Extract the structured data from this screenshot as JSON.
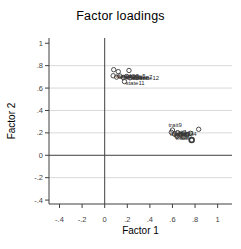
{
  "chart_data": {
    "type": "scatter",
    "title": "Factor loadings",
    "xlabel": "Factor 1",
    "ylabel": "Factor 2",
    "xlim": [
      -0.493,
      1.127
    ],
    "ylim": [
      -0.435,
      1.047
    ],
    "xticks": {
      "values": [
        -0.4,
        -0.2,
        0,
        0.2,
        0.4,
        0.6,
        0.8,
        1
      ],
      "labels": [
        "-.4",
        "-.2",
        "0",
        ".2",
        ".4",
        ".6",
        ".8",
        "1"
      ]
    },
    "yticks": {
      "values": [
        1,
        0.8,
        0.6,
        0.4,
        0.2,
        0,
        -0.2,
        -0.4
      ],
      "labels": [
        "1",
        ".8",
        ".6",
        ".4",
        ".2",
        "0",
        "-.2",
        "-.4"
      ]
    },
    "grid": {
      "y_values": [
        0.8,
        0.6,
        0.4,
        0.2,
        -0.2
      ]
    },
    "zero_lines": {
      "x": 0,
      "y": 0
    },
    "legend": "none",
    "colors": {
      "axis": "#3f3f3f",
      "grid": "#d9d9d9",
      "marker": "#3a3a3a",
      "point_label": "#2b2b2b",
      "text": "#3c3c3c"
    },
    "series": [
      {
        "name": "state items",
        "marker": "hollow-circle",
        "points": [
          {
            "x": 0.08,
            "y": 0.764
          },
          {
            "x": 0.12,
            "y": 0.747
          },
          {
            "x": 0.215,
            "y": 0.757
          },
          {
            "x": 0.075,
            "y": 0.71,
            "label": "state1"
          },
          {
            "x": 0.105,
            "y": 0.698,
            "label": "state2"
          },
          {
            "x": 0.135,
            "y": 0.708,
            "label": "state3"
          },
          {
            "x": 0.165,
            "y": 0.694,
            "label": "state4"
          },
          {
            "x": 0.195,
            "y": 0.704,
            "label": "state5"
          },
          {
            "x": 0.225,
            "y": 0.692,
            "label": "state6"
          },
          {
            "x": 0.255,
            "y": 0.7,
            "label": "state7"
          },
          {
            "x": 0.285,
            "y": 0.694,
            "label": "state12"
          },
          {
            "x": 0.175,
            "y": 0.658,
            "label": "state11",
            "ldx": 1,
            "ldy": 3
          }
        ]
      },
      {
        "name": "trait items",
        "marker": "hollow-circle",
        "points": [
          {
            "x": 0.832,
            "y": 0.232
          },
          {
            "x": 0.77,
            "y": 0.137,
            "bold": true
          },
          {
            "x": 0.6,
            "y": 0.225,
            "label": "trait9",
            "ldx": -4,
            "ldy": -3
          },
          {
            "x": 0.59,
            "y": 0.205,
            "label": "trait1"
          },
          {
            "x": 0.618,
            "y": 0.19,
            "label": "trait2"
          },
          {
            "x": 0.646,
            "y": 0.202,
            "label": "trait3"
          },
          {
            "x": 0.674,
            "y": 0.188,
            "label": "trait4"
          },
          {
            "x": 0.702,
            "y": 0.198,
            "label": "trait5",
            "ldx": -14,
            "ldy": 3
          },
          {
            "x": 0.73,
            "y": 0.184,
            "label": "trait6",
            "ldx": -14,
            "ldy": 2
          },
          {
            "x": 0.758,
            "y": 0.196,
            "label": "trait7",
            "ldx": -15,
            "ldy": 3
          },
          {
            "x": 0.7,
            "y": 0.163,
            "label": "trait8",
            "ldx": -8,
            "ldy": 3
          },
          {
            "x": 0.64,
            "y": 0.17,
            "label": "trait10",
            "ldx": -2,
            "ldy": 3
          }
        ]
      }
    ]
  }
}
